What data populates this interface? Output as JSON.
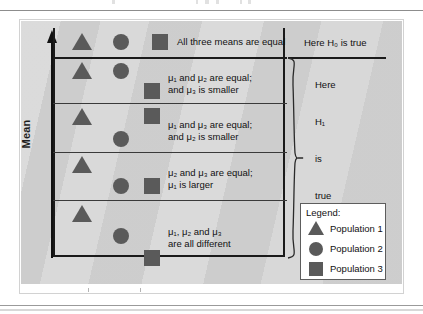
{
  "figure": {
    "axis_label": "Mean",
    "colors": {
      "panel_background": "#d4d4d4",
      "symbol_fill": "#5a5a5a",
      "border": "#1a1a1a",
      "page_background": "#ffffff"
    },
    "rows": [
      {
        "id": "row-1",
        "description": [
          "All three means are equal"
        ],
        "right_label": "Here H₀ is true",
        "symbols": [
          {
            "shape": "triangle",
            "population": "Population 1",
            "level": "equal-high"
          },
          {
            "shape": "circle",
            "population": "Population 2",
            "level": "equal-high"
          },
          {
            "shape": "square",
            "population": "Population 3",
            "level": "equal-high"
          }
        ]
      },
      {
        "id": "row-2",
        "description": [
          "μ₁ and μ₂ are equal;",
          "and μ₃ is smaller"
        ],
        "right_label": "Here",
        "symbols": [
          {
            "shape": "triangle",
            "population": "Population 1",
            "level": "high"
          },
          {
            "shape": "circle",
            "population": "Population 2",
            "level": "high"
          },
          {
            "shape": "square",
            "population": "Population 3",
            "level": "low"
          }
        ]
      },
      {
        "id": "row-3",
        "description": [
          "μ₁ and μ₃ are equal;",
          "and μ₂ is smaller"
        ],
        "right_label": "H₁",
        "symbols": [
          {
            "shape": "triangle",
            "population": "Population 1",
            "level": "high"
          },
          {
            "shape": "square",
            "population": "Population 3",
            "level": "high"
          },
          {
            "shape": "circle",
            "population": "Population 2",
            "level": "low"
          }
        ]
      },
      {
        "id": "row-4",
        "description": [
          "μ₂ and μ₃ are equal;",
          "μ₁ is larger"
        ],
        "right_label": "is",
        "symbols": [
          {
            "shape": "triangle",
            "population": "Population 1",
            "level": "high"
          },
          {
            "shape": "circle",
            "population": "Population 2",
            "level": "low"
          },
          {
            "shape": "square",
            "population": "Population 3",
            "level": "low"
          }
        ]
      },
      {
        "id": "row-5",
        "description": [
          "μ₁, μ₂ and μ₃",
          "are all different"
        ],
        "right_label": "true",
        "symbols": [
          {
            "shape": "triangle",
            "population": "Population 1",
            "level": "high"
          },
          {
            "shape": "circle",
            "population": "Population 2",
            "level": "middle"
          },
          {
            "shape": "square",
            "population": "Population 3",
            "level": "low"
          }
        ]
      }
    ],
    "right_column": {
      "top_label": "Here H₀ is true",
      "brace_labels": [
        "Here",
        "H₁",
        "is",
        "true"
      ]
    },
    "legend": {
      "title": "Legend:",
      "entries": [
        {
          "shape": "triangle",
          "label": "Population 1"
        },
        {
          "shape": "circle",
          "label": "Population 2"
        },
        {
          "shape": "square",
          "label": "Population 3"
        }
      ]
    }
  }
}
